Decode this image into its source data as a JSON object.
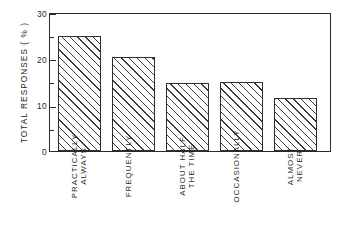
{
  "chart_data": {
    "type": "bar",
    "title": "",
    "subtitle": "",
    "xlabel": "",
    "ylabel": "TOTAL RESPONSES ( % )",
    "categories": [
      "PRACTICALLY ALWAYS",
      "FREQUENTLY",
      "ABOUT HALF THE TIME",
      "OCCASIONALLY",
      "ALMOST NEVER"
    ],
    "category_lines": [
      [
        "PRACTICALLY",
        "ALWAYS"
      ],
      [
        "FREQUENTLY",
        ""
      ],
      [
        "ABOUT HALF",
        "THE TIME"
      ],
      [
        "OCCASIONALLY",
        ""
      ],
      [
        "ALMOST",
        "NEVER"
      ]
    ],
    "values": [
      24.8,
      20.3,
      14.6,
      14.9,
      11.5
    ],
    "ylim": [
      0,
      30
    ],
    "ytick_major": [
      0,
      10,
      20,
      30
    ],
    "ytick_major_labels": [
      "0",
      "10",
      "20",
      "30"
    ],
    "ytick_minor": [
      5,
      15,
      25
    ],
    "grid": false,
    "legend": null,
    "bar_fill": "hatched-diagonal",
    "bar_edge_color": "#2e2e2e",
    "axis_color": "#2a2a2a",
    "background_color": "#ffffff"
  }
}
